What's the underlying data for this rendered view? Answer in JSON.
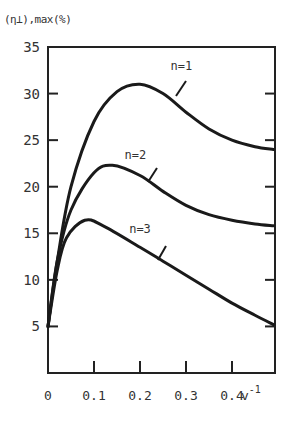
{
  "chart_data": {
    "type": "line",
    "title": "",
    "xlabel": "v^-1",
    "ylabel": "(η⊥),max (%)",
    "xlim": [
      0,
      0.49
    ],
    "ylim": [
      0,
      35
    ],
    "x_ticks": [
      0,
      0.1,
      0.2,
      0.3,
      0.4
    ],
    "x_tick_labels": [
      "0",
      "0.1",
      "0.2",
      "0.3",
      "0.4"
    ],
    "y_ticks": [
      5,
      10,
      15,
      20,
      25,
      30,
      35
    ],
    "y_tick_labels": [
      "5",
      "10",
      "15",
      "20",
      "25",
      "30",
      "35"
    ],
    "grid": false,
    "legend": "inline labels with leader lines",
    "series": [
      {
        "name": "n=1",
        "x": [
          0,
          0.02,
          0.05,
          0.1,
          0.15,
          0.2,
          0.25,
          0.3,
          0.35,
          0.4,
          0.45,
          0.49
        ],
        "values": [
          5,
          12,
          20,
          27,
          30.2,
          31,
          30,
          28,
          26.2,
          25,
          24.3,
          24
        ]
      },
      {
        "name": "n=2",
        "x": [
          0,
          0.02,
          0.05,
          0.1,
          0.14,
          0.2,
          0.25,
          0.3,
          0.35,
          0.4,
          0.45,
          0.49
        ],
        "values": [
          5,
          12,
          17.5,
          21.5,
          22.3,
          21.2,
          19.5,
          18,
          17,
          16.4,
          16,
          15.8
        ]
      },
      {
        "name": "n=3",
        "x": [
          0,
          0.02,
          0.04,
          0.08,
          0.12,
          0.2,
          0.25,
          0.3,
          0.35,
          0.4,
          0.45,
          0.49
        ],
        "values": [
          5,
          11,
          14.5,
          16.4,
          15.8,
          13.5,
          12,
          10.5,
          9,
          7.5,
          6.2,
          5.2
        ]
      }
    ],
    "annotations": [
      {
        "text": "n=1",
        "x": 0.29,
        "y": 32.5
      },
      {
        "text": "n=2",
        "x": 0.19,
        "y": 23.0
      },
      {
        "text": "n=3",
        "x": 0.2,
        "y": 15.0
      }
    ]
  },
  "axis": {
    "ylabel_text": "(η⊥),max(%)",
    "xlabel_base": "v",
    "xlabel_sup": "-1"
  }
}
